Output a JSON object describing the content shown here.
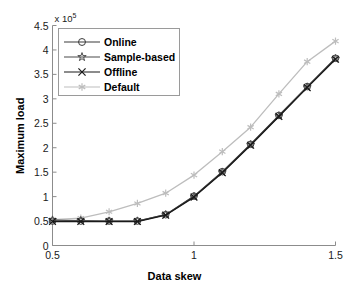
{
  "chart_data": {
    "type": "line",
    "title": "",
    "xlabel": "Data skew",
    "ylabel": "Maximum load",
    "y_multiplier": "x 10",
    "y_multiplier_exponent": "5",
    "xlim": [
      0.5,
      1.5
    ],
    "ylim": [
      0,
      450000
    ],
    "xticks": [
      0.5,
      1,
      1.5
    ],
    "xtick_labels": [
      "0.5",
      "1",
      "1.5"
    ],
    "yticks": [
      0,
      50000,
      100000,
      150000,
      200000,
      250000,
      300000,
      350000,
      400000,
      450000
    ],
    "ytick_labels": [
      "0",
      "0.5",
      "1",
      "1.5",
      "2",
      "2.5",
      "3",
      "3.5",
      "4",
      "4.5"
    ],
    "grid": false,
    "legend_position": "upper left",
    "x": [
      0.5,
      0.6,
      0.7,
      0.8,
      0.9,
      1.0,
      1.1,
      1.2,
      1.3,
      1.4,
      1.5
    ],
    "series": [
      {
        "name": "Online",
        "marker": "circle",
        "color": "#3a3a3a",
        "values": [
          50000,
          50000,
          50000,
          50000,
          63000,
          101000,
          151000,
          207000,
          266000,
          325000,
          383000
        ]
      },
      {
        "name": "Sample-based",
        "marker": "pentagram",
        "color": "#4a4a4a",
        "values": [
          52000,
          51000,
          50000,
          50000,
          63000,
          100000,
          150000,
          206000,
          265000,
          324000,
          382000
        ]
      },
      {
        "name": "Offline",
        "marker": "x",
        "color": "#1a1a1a",
        "values": [
          49000,
          49000,
          49000,
          49000,
          62000,
          99000,
          149000,
          205000,
          264000,
          323000,
          381000
        ]
      },
      {
        "name": "Default",
        "marker": "asterisk",
        "color": "#bdbdbd",
        "values": [
          53000,
          56000,
          69000,
          86000,
          107000,
          144000,
          192000,
          242000,
          310000,
          376000,
          418000
        ]
      }
    ]
  },
  "legend": {
    "items": [
      {
        "label": "Online"
      },
      {
        "label": "Sample-based"
      },
      {
        "label": "Offline"
      },
      {
        "label": "Default"
      }
    ]
  },
  "axes": {
    "axis_color": "#8c8c8c"
  }
}
